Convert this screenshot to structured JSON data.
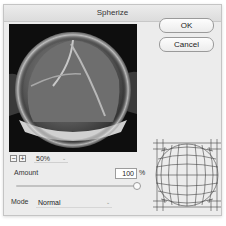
{
  "dialog": {
    "title": "Spherize",
    "buttons": {
      "ok": "OK",
      "cancel": "Cancel"
    },
    "zoom": {
      "out_icon": "minus-icon",
      "in_icon": "plus-icon",
      "level": "50%"
    },
    "amount": {
      "label": "Amount",
      "value": "100",
      "unit": "%"
    },
    "mode": {
      "label": "Mode",
      "selected": "Normal"
    },
    "preview": {
      "subject": "spherized grayscale image of a cracked bread loaf"
    }
  }
}
